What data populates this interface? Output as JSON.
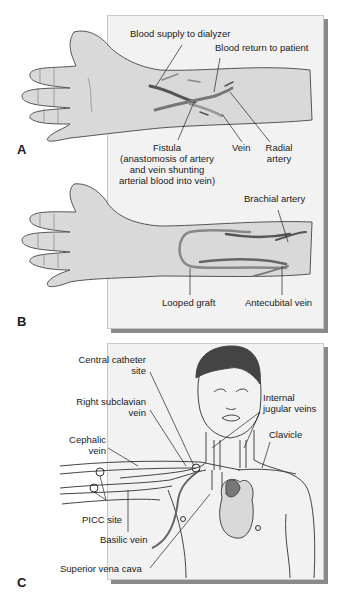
{
  "panels": {
    "A": {
      "letter": "A",
      "labels": {
        "blood_supply": "Blood supply to dialyzer",
        "blood_return": "Blood return to patient",
        "fistula_1": "Fistula",
        "fistula_2": "(anastomosis of artery",
        "fistula_3": "and vein shunting",
        "fistula_4": "arterial blood into vein)",
        "vein": "Vein",
        "radial_1": "Radial",
        "radial_2": "artery"
      }
    },
    "B": {
      "letter": "B",
      "labels": {
        "brachial": "Brachial artery",
        "looped_graft": "Looped graft",
        "antecubital": "Antecubital vein"
      }
    },
    "C": {
      "letter": "C",
      "labels": {
        "central_1": "Central catheter",
        "central_2": "site",
        "subclavian_1": "Right subclavian",
        "subclavian_2": "vein",
        "cephalic_1": "Cephalic",
        "cephalic_2": "vein",
        "jugular_1": "Internal",
        "jugular_2": "jugular veins",
        "clavicle": "Clavicle",
        "picc": "PICC site",
        "basilic": "Basilic vein",
        "svc": "Superior vena cava"
      }
    }
  },
  "colors": {
    "panel_bg": "#f2f2f2",
    "skin": "#d9d9d9",
    "vessel_dark": "#555555",
    "vessel_mid": "#8c8c8c",
    "shadow": "#8a8a8a"
  }
}
